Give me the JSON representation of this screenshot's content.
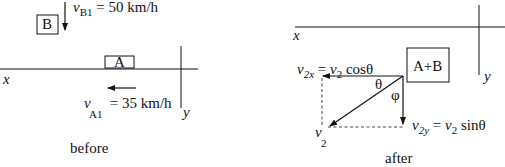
{
  "before": {
    "caption": "before",
    "axis_x_label": "x",
    "axis_y_label": "y",
    "box_b_label": "B",
    "box_a_label": "A",
    "vB1": {
      "symbol": "v",
      "sub": "B1",
      "value": " = 50 km/h"
    },
    "vA1": {
      "symbol": "v",
      "sub": "A1",
      "value": " = 35 km/h"
    }
  },
  "after": {
    "caption": "after",
    "axis_x_label": "x",
    "axis_y_label": "y",
    "box_label": "A+B",
    "theta": "θ",
    "phi": "φ",
    "v2x": {
      "symbol": "v",
      "sub": "2x",
      "eq": " = ",
      "rhs_symbol": "v",
      "rhs_sub": "2",
      "rhs_func": " cosθ"
    },
    "v2y": {
      "symbol": "v",
      "sub": "2y",
      "eq": " = ",
      "rhs_symbol": "v",
      "rhs_sub": "2",
      "rhs_func": " sinθ"
    },
    "v2": {
      "symbol": "v",
      "sub": "2"
    }
  },
  "colors": {
    "ink": "#111111",
    "background": "#ffffff"
  }
}
